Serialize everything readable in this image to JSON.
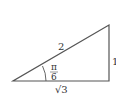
{
  "diagram": {
    "type": "right-triangle",
    "hypotenuse_label": "2",
    "opposite_label": "1",
    "adjacent_label": "√3",
    "angle_label_num": "π",
    "angle_label_den": "6",
    "stroke_color": "#555555"
  }
}
